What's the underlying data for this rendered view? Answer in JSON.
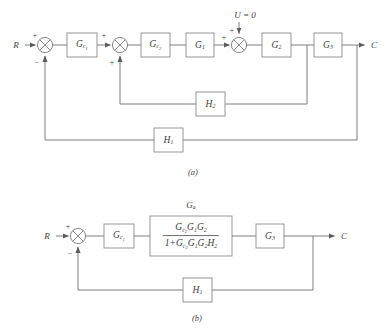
{
  "figure": {
    "kind": "control-system-block-diagram",
    "panels": [
      {
        "caption": "(a)",
        "input_label": "R",
        "output_label": "C",
        "disturbance_label": "U = 0",
        "blocks": [
          {
            "name": "G_c1",
            "html": "G<sub>c<sub>1</sub></sub>"
          },
          {
            "name": "G_c2",
            "html": "G<sub>c<sub>2</sub></sub>"
          },
          {
            "name": "G_1",
            "html": "G<sub>1</sub>"
          },
          {
            "name": "G_2",
            "html": "G<sub>2</sub>"
          },
          {
            "name": "G_3",
            "html": "G<sub>3</sub>"
          },
          {
            "name": "H_2",
            "html": "H<sub>2</sub>"
          },
          {
            "name": "H_1",
            "html": "H<sub>1</sub>"
          }
        ],
        "summing_junctions": [
          {
            "name": "sum-1",
            "signs": [
              "+",
              "-"
            ]
          },
          {
            "name": "sum-2",
            "signs": [
              "+",
              "+"
            ]
          },
          {
            "name": "sum-3",
            "signs": [
              "+",
              "+"
            ]
          }
        ]
      },
      {
        "caption": "(b)",
        "input_label": "R",
        "output_label": "C",
        "equivalent_block_label": "G<sub>a</sub>",
        "equivalent_block_numerator": "G<sub>c<sub>2</sub></sub>G<sub>1</sub>G<sub>2</sub>",
        "equivalent_block_denominator": "1+G<sub>c<sub>2</sub></sub>G<sub>1</sub>G<sub>2</sub>H<sub>2</sub>",
        "blocks": [
          {
            "name": "G_c1",
            "html": "G<sub>c<sub>1</sub></sub>"
          },
          {
            "name": "G_3",
            "html": "G<sub>3</sub>"
          },
          {
            "name": "H_1",
            "html": "H<sub>1</sub>"
          }
        ],
        "summing_junctions": [
          {
            "name": "sum-1",
            "signs": [
              "+",
              "-"
            ]
          }
        ]
      }
    ]
  },
  "panel_a": {
    "caption": "(a)",
    "input": "R",
    "output": "C",
    "disturbance": "U = 0",
    "sum1_plus": "+",
    "sum1_minus": "−",
    "sum2_plus_in": "+",
    "sum2_plus_fb": "+",
    "sum3_plus_in": "+",
    "sum3_plus_top": "+",
    "gc1": "G",
    "gc1_sub": "c",
    "gc1_subsub": "1",
    "gc2_sub": "c",
    "gc2_subsub": "2",
    "g1_sub": "1",
    "g2_sub": "2",
    "g3_sub": "3",
    "h2_sub": "2",
    "h1_sub": "1",
    "g_letter": "G",
    "h_letter": "H"
  },
  "panel_b": {
    "caption": "(b)",
    "input": "R",
    "output": "C",
    "sum1_plus": "+",
    "sum1_minus": "−",
    "ga_letter": "G",
    "ga_sub": "a",
    "numerator": "G",
    "denominator_lead": "1+",
    "g_letter": "G",
    "h_letter": "H",
    "gc1_sub": "c",
    "gc1_subsub": "1",
    "g3_sub": "3",
    "h1_sub": "1"
  },
  "colors": {
    "line": "#6f6f6f",
    "block_stroke": "#8a8a8a",
    "text": "#3f3f3f",
    "background": "#ffffff"
  }
}
